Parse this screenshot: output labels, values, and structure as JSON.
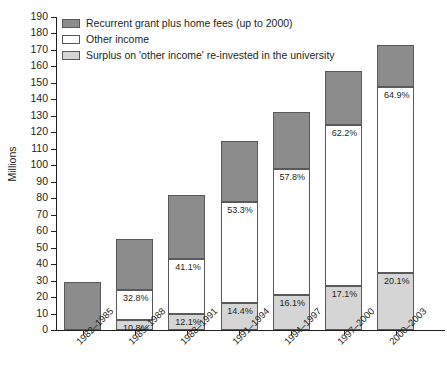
{
  "chart_data": {
    "type": "bar",
    "title": "",
    "subtitle": "",
    "xlabel": "",
    "ylabel": "Millions",
    "ylim": [
      0,
      190
    ],
    "ytick_step": 10,
    "yticks": [
      0,
      10,
      20,
      30,
      40,
      50,
      60,
      70,
      80,
      90,
      100,
      110,
      120,
      130,
      140,
      150,
      160,
      170,
      180,
      190
    ],
    "grid": false,
    "stacked": true,
    "legend_position": "top-left",
    "categories": [
      "1982–1985",
      "1985–1988",
      "1988–1991",
      "1991–1994",
      "1994–1997",
      "1997–2000",
      "2000–2003"
    ],
    "series": [
      {
        "name": "Recurrent grant plus home fees (up to 2000)",
        "color": "#8c8c8c",
        "values": [
          29.0,
          31.0,
          38.7,
          37.2,
          34.7,
          32.4,
          26.0
        ]
      },
      {
        "name": "Other income",
        "color": "#ffffff",
        "values": [
          0.0,
          18.4,
          33.3,
          61.0,
          76.3,
          97.7,
          112.5
        ]
      },
      {
        "name": "Surplus on 'other income' re-invested in the university",
        "color": "#d5d5d5",
        "values": [
          0.0,
          6.1,
          9.8,
          16.5,
          21.3,
          26.9,
          34.8
        ]
      }
    ],
    "totals": [
      29.0,
      55.5,
      81.8,
      114.7,
      132.3,
      157.0,
      173.3
    ],
    "data_labels": {
      "other_income_pct": [
        "",
        "32.8%",
        "41.1%",
        "53.3%",
        "57.8%",
        "62.2%",
        "64.9%"
      ],
      "surplus_pct": [
        "",
        "10.8%",
        "12.1%",
        "14.4%",
        "16.1%",
        "17.1%",
        "20.1%"
      ]
    }
  },
  "legend": {
    "items": [
      {
        "label": "Recurrent grant plus home fees (up to 2000)",
        "swatch": "sw-grant"
      },
      {
        "label": "Other income",
        "swatch": "sw-other"
      },
      {
        "label": "Surplus on 'other income' re-invested in the university",
        "swatch": "sw-surplus"
      }
    ]
  }
}
